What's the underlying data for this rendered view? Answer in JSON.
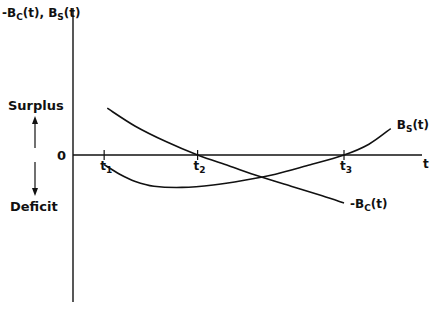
{
  "chart_data": {
    "type": "line",
    "title": "",
    "ylabel": "-B_C(t), B_S(t)",
    "ylabel_parts": {
      "main1": "-B",
      "sub1": "C",
      "tail1": "(t), ",
      "main2": "B",
      "sub2": "S",
      "tail2": "(t)"
    },
    "xlabel": "t",
    "origin_label": "0",
    "upper_region_label": "Surplus",
    "lower_region_label": "Deficit",
    "grid": false,
    "x_ticks": [
      {
        "label": "t",
        "sub": "1",
        "x": 1.0
      },
      {
        "label": "t",
        "sub": "2",
        "x": 4.0
      },
      {
        "label": "t",
        "sub": "3",
        "x": 8.7
      }
    ],
    "xlim": [
      0,
      11.3
    ],
    "ylim": [
      -5.5,
      5.2
    ],
    "series": [
      {
        "name": "-B_C(t)",
        "label_main": "-B",
        "label_sub": "C",
        "label_tail": "(t)",
        "points": [
          [
            1.1,
            3.9
          ],
          [
            2.0,
            2.4
          ],
          [
            3.0,
            1.1
          ],
          [
            4.0,
            0.0
          ],
          [
            5.0,
            -0.9
          ],
          [
            6.0,
            -1.8
          ],
          [
            7.0,
            -2.6
          ],
          [
            8.0,
            -3.4
          ],
          [
            8.7,
            -4.0
          ]
        ]
      },
      {
        "name": "B_S(t)",
        "label_main": "B",
        "label_sub": "S",
        "label_tail": "(t)",
        "points": [
          [
            1.0,
            -0.8
          ],
          [
            1.5,
            -1.6
          ],
          [
            2.0,
            -2.2
          ],
          [
            2.6,
            -2.6
          ],
          [
            3.5,
            -2.7
          ],
          [
            4.5,
            -2.5
          ],
          [
            5.5,
            -2.1
          ],
          [
            6.5,
            -1.6
          ],
          [
            7.5,
            -0.9
          ],
          [
            8.7,
            0.0
          ],
          [
            9.5,
            0.9
          ],
          [
            10.2,
            2.2
          ]
        ]
      }
    ]
  }
}
